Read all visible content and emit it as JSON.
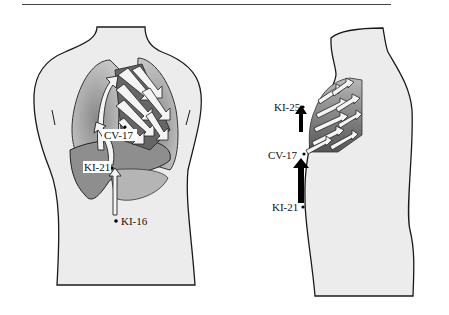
{
  "figure": {
    "views": [
      {
        "id": "front",
        "name": "Front view of torso",
        "points": [
          {
            "label": "CV-17"
          },
          {
            "label": "KI-21"
          },
          {
            "label": "KI-16"
          }
        ]
      },
      {
        "id": "side",
        "name": "Side view of torso",
        "points": [
          {
            "label": "KI-25"
          },
          {
            "label": "CV-17"
          },
          {
            "label": "KI-21"
          }
        ]
      }
    ],
    "colors": {
      "body_fill": "#ededed",
      "outline": "#1a1a1a",
      "lung_fill": "#a8a8a8",
      "liver_fill": "#8c8c8c",
      "heart_fill": "#6e6e6e",
      "arrow_fill": "#f4f4f4",
      "black_arrow": "#000000"
    }
  }
}
